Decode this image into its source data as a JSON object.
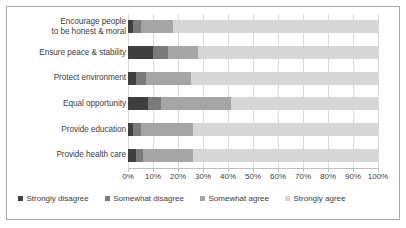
{
  "chart_data": {
    "type": "bar",
    "orientation": "horizontal",
    "stacked": true,
    "normalized_percent": true,
    "title": "",
    "subtitle": "",
    "xlabel": "",
    "ylabel": "",
    "xlim": [
      0,
      100
    ],
    "xticks": [
      "0%",
      "10%",
      "20%",
      "30%",
      "40%",
      "50%",
      "60%",
      "70%",
      "80%",
      "90%",
      "100%"
    ],
    "xtick_values": [
      0,
      10,
      20,
      30,
      40,
      50,
      60,
      70,
      80,
      90,
      100
    ],
    "grid": true,
    "grid_axis": "x",
    "legend_position": "bottom",
    "categories": [
      "Encourage people to be honest & moral",
      "Ensure peace & stability",
      "Protect environment",
      "Equal opportunity",
      "Provide education",
      "Provide health care"
    ],
    "category_lines": [
      [
        "Encourage people",
        "to be honest & moral"
      ],
      [
        "Ensure peace & stability"
      ],
      [
        "Protect environment"
      ],
      [
        "Equal opportunity"
      ],
      [
        "Provide education"
      ],
      [
        "Provide health care"
      ]
    ],
    "series": [
      {
        "name": "Strongly disagree",
        "color": "#3f3f3f",
        "values": [
          2,
          10,
          3,
          8,
          2,
          3
        ]
      },
      {
        "name": "Somewhat disagree",
        "color": "#7b7b7b",
        "values": [
          3,
          6,
          4,
          5,
          3,
          3
        ]
      },
      {
        "name": "Somewhat agree",
        "color": "#a5a5a5",
        "values": [
          13,
          12,
          18,
          28,
          21,
          20
        ]
      },
      {
        "name": "Strongly agree",
        "color": "#d6d6d6",
        "values": [
          82,
          72,
          75,
          59,
          74,
          74
        ]
      }
    ],
    "legend": [
      "Strongly disagree",
      "Somewhat disagree",
      "Somewhat agree",
      "Strongly agree"
    ],
    "colors": {
      "strongly_disagree": "#3f3f3f",
      "somewhat_disagree": "#7b7b7b",
      "somewhat_agree": "#a5a5a5",
      "strongly_agree": "#d6d6d6",
      "gridline": "#d9d9d9",
      "axis": "#bfbfbf",
      "text": "#404040",
      "border": "#a6a6a6",
      "background": "#ffffff"
    }
  }
}
